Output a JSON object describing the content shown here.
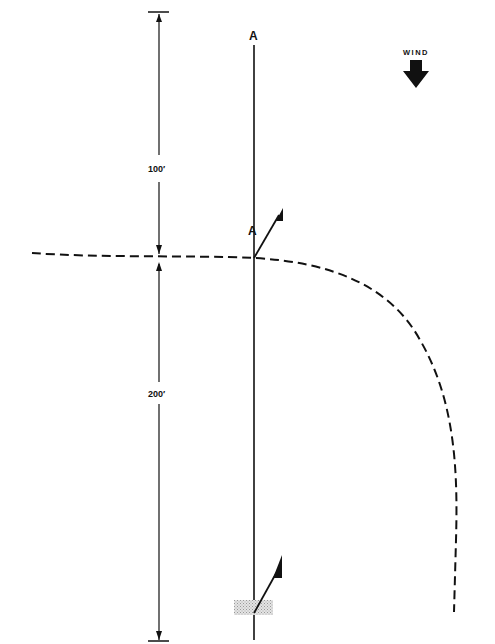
{
  "diagram": {
    "wind_label": "WIND",
    "wind_direction": "down",
    "line_label_top": "A",
    "line_label_mid": "A",
    "dimension_upper": "100′",
    "dimension_lower": "200′",
    "colors": {
      "ink": "#111111",
      "ground_patch": "#bbbbbb",
      "background": "#ffffff"
    }
  }
}
